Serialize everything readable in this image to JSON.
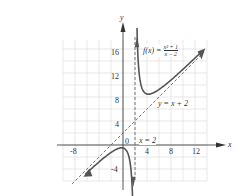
{
  "chart_data": {
    "type": "line",
    "title": "",
    "function_label": "f(x) = (x^2 + 1)/(x - 2)",
    "func_num": "x² + 1",
    "func_den": "x − 2",
    "func_prefix": "f(x) =",
    "xlabel": "x",
    "ylabel": "y",
    "origin_label": "0",
    "xlim": [
      -10,
      14
    ],
    "ylim": [
      -6,
      18
    ],
    "x_ticks": [
      "-8",
      "4",
      "8",
      "12"
    ],
    "y_ticks": [
      "16",
      "12",
      "8",
      "4",
      "-4"
    ],
    "grid": true,
    "asymptotes": [
      {
        "type": "vertical",
        "label": "x = 2",
        "equation": "x = 2"
      },
      {
        "type": "oblique",
        "label": "y = x + 2",
        "equation": "y = x + 2"
      }
    ],
    "series": [
      {
        "name": "f(x)",
        "branch": "right",
        "x": [
          2.3,
          2.5,
          3,
          4,
          5,
          6,
          8,
          10,
          12,
          13
        ],
        "y": [
          20.0,
          14.5,
          10,
          8.5,
          8.67,
          9.25,
          10.83,
          12.63,
          14.5,
          15.45
        ]
      },
      {
        "name": "f(x)",
        "branch": "left",
        "x": [
          -6.5,
          -4,
          -2,
          0,
          1,
          1.5,
          1.7
        ],
        "y": [
          -5.03,
          -2.83,
          -1.25,
          -0.5,
          -2,
          -6.5,
          -9.6
        ]
      }
    ]
  }
}
